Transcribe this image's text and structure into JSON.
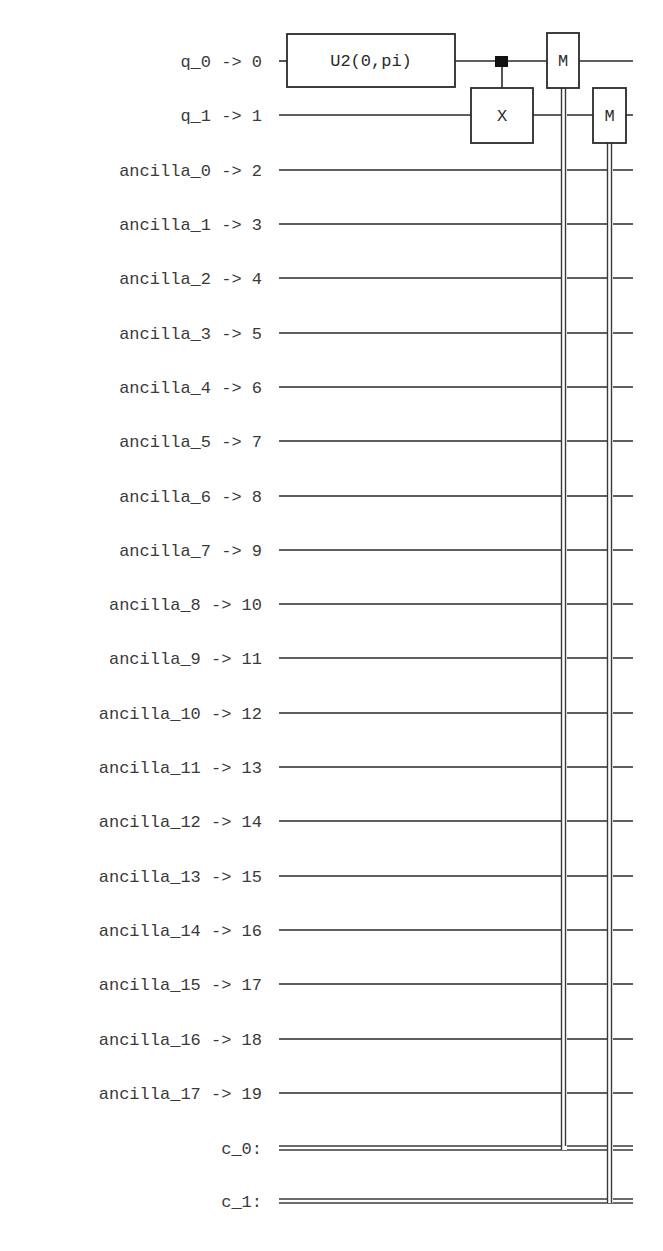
{
  "circuit": {
    "qubit_labels": [
      {
        "name": "q_0",
        "index": "0",
        "text": "q_0 -> 0"
      },
      {
        "name": "q_1",
        "index": "1",
        "text": "q_1 -> 1"
      },
      {
        "name": "ancilla_0",
        "index": "2",
        "text": "ancilla_0 -> 2"
      },
      {
        "name": "ancilla_1",
        "index": "3",
        "text": "ancilla_1 -> 3"
      },
      {
        "name": "ancilla_2",
        "index": "4",
        "text": "ancilla_2 -> 4"
      },
      {
        "name": "ancilla_3",
        "index": "5",
        "text": "ancilla_3 -> 5"
      },
      {
        "name": "ancilla_4",
        "index": "6",
        "text": "ancilla_4 -> 6"
      },
      {
        "name": "ancilla_5",
        "index": "7",
        "text": "ancilla_5 -> 7"
      },
      {
        "name": "ancilla_6",
        "index": "8",
        "text": "ancilla_6 -> 8"
      },
      {
        "name": "ancilla_7",
        "index": "9",
        "text": "ancilla_7 -> 9"
      },
      {
        "name": "ancilla_8",
        "index": "10",
        "text": "ancilla_8 -> 10"
      },
      {
        "name": "ancilla_9",
        "index": "11",
        "text": "ancilla_9 -> 11"
      },
      {
        "name": "ancilla_10",
        "index": "12",
        "text": "ancilla_10 -> 12"
      },
      {
        "name": "ancilla_11",
        "index": "13",
        "text": "ancilla_11 -> 13"
      },
      {
        "name": "ancilla_12",
        "index": "14",
        "text": "ancilla_12 -> 14"
      },
      {
        "name": "ancilla_13",
        "index": "15",
        "text": "ancilla_13 -> 15"
      },
      {
        "name": "ancilla_14",
        "index": "16",
        "text": "ancilla_14 -> 16"
      },
      {
        "name": "ancilla_15",
        "index": "17",
        "text": "ancilla_15 -> 17"
      },
      {
        "name": "ancilla_16",
        "index": "18",
        "text": "ancilla_16 -> 18"
      },
      {
        "name": "ancilla_17",
        "index": "19",
        "text": "ancilla_17 -> 19"
      }
    ],
    "classical_labels": [
      {
        "name": "c_0",
        "text": "c_0:"
      },
      {
        "name": "c_1",
        "text": "c_1:"
      }
    ],
    "gates": {
      "u2": {
        "label": "U2(0,pi)",
        "qubit": 0
      },
      "cx": {
        "target_label": "X",
        "control": 0,
        "target": 1
      },
      "measure_0": {
        "label": "M",
        "qubit": 0,
        "clbit": 0
      },
      "measure_1": {
        "label": "M",
        "qubit": 1,
        "clbit": 1
      }
    },
    "colors": {
      "ink": "#2a2a2a",
      "label": "#3a3a3a",
      "background": "#ffffff"
    }
  }
}
